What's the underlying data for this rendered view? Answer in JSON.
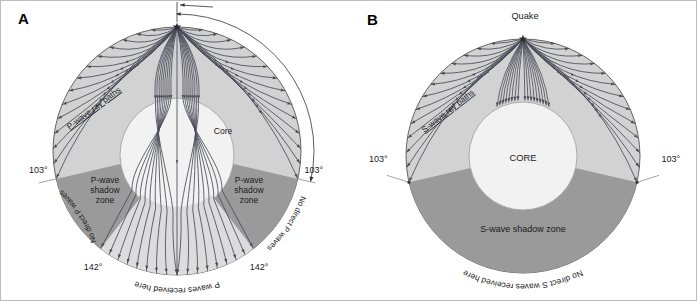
{
  "figure": {
    "type": "two-panel-scientific-diagram",
    "border_color": "#bdbdbd",
    "background": "#ffffff"
  },
  "colors": {
    "mantle_light": "#d2d2d2",
    "shadow_zone_dark": "#9a9a9a",
    "core_fill": "#f2f2f2",
    "ray_stroke": "#4a4a58",
    "outline": "#555555",
    "text": "#1a1a1a"
  },
  "panel_a": {
    "letter": "A",
    "wave_type": "P",
    "labels": {
      "ray_paths": "P-wave ray paths",
      "core": "Core",
      "shadow_zone_left": "P-wave\nshadow\nzone",
      "shadow_zone_left_lines": [
        "P-wave",
        "shadow",
        "zone"
      ],
      "shadow_zone_right_lines": [
        "P-wave",
        "shadow",
        "zone"
      ],
      "angle_top_arc": "103°",
      "angle_left_outer": "103°",
      "angle_right_outer": "103°",
      "angle_left_lower": "142°",
      "angle_right_lower": "142°",
      "no_direct_left": "No direct P waves",
      "no_direct_right": "No direct P waves",
      "received_here": "P waves  received  here"
    },
    "geometry": {
      "center_x": 176,
      "center_y": 150,
      "earth_radius": 124,
      "core_radius": 57,
      "quake_angle_deg": 90,
      "shadow_start_deg": 103,
      "shadow_end_deg": 142,
      "ray_count": 34
    }
  },
  "panel_b": {
    "letter": "B",
    "wave_type": "S",
    "labels": {
      "quake": "Quake",
      "ray_paths": "S-wave ray paths",
      "core": "CORE",
      "shadow_zone": "S-wave shadow zone",
      "angle_left": "103°",
      "angle_right": "103°",
      "no_direct": "No  direct  S waves  received  here"
    },
    "geometry": {
      "center_x": 172,
      "center_y": 155,
      "earth_radius": 117,
      "core_radius": 54,
      "quake_angle_deg": 90,
      "shadow_start_deg": 103,
      "ray_count": 30
    }
  }
}
